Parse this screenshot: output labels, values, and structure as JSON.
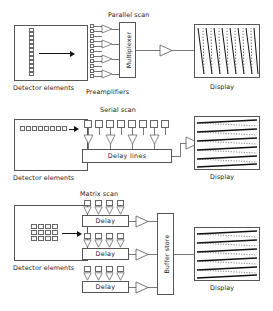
{
  "diagram": {
    "title_semantic": "detector-array-scan-architectures",
    "rows": [
      {
        "id": "parallel",
        "scan_label": "Parallel scan",
        "detector_caption": "Detector elements",
        "detector_layout": "vertical-column",
        "detector_count": 12,
        "preamp_label": "Preamplifiers",
        "preamp_count": 4,
        "input_line_count": 12,
        "processor_label": "Multiplexer",
        "processor_orientation": "vertical",
        "output_amp_count": 1,
        "display_caption": "Display",
        "display_pattern": "slanted-vertical-scan-lines",
        "display_line_count": 8
      },
      {
        "id": "serial",
        "scan_label": "Serial scan",
        "detector_caption": "Detector elements",
        "detector_layout": "horizontal-row",
        "detector_count": 8,
        "element_count": 8,
        "amp_count": 4,
        "processor_label": "Delay lines",
        "processor_orientation": "horizontal",
        "output_amp_count": 1,
        "display_caption": "Display",
        "display_pattern": "horizontal-wedge-scan-lines",
        "display_line_count": 6
      },
      {
        "id": "matrix",
        "scan_label": "Matrix scan",
        "detector_caption": "Detector elements",
        "detector_layout": "matrix-4x3",
        "detector_cols": 4,
        "detector_rows": 3,
        "delay_label": "Delay",
        "delay_block_count": 3,
        "elements_per_block": 4,
        "amps_per_block": 4,
        "processor_label": "Buffer store",
        "processor_orientation": "vertical",
        "output_amp_count": 3,
        "display_caption": "Display",
        "display_pattern": "horizontal-wedge-scan-lines",
        "display_line_count": 6
      }
    ],
    "colors": {
      "ink": "#1a1a1a",
      "stroke": "#555555",
      "wire": "#777777",
      "arrow": "#111111",
      "background": "#ffffff"
    }
  }
}
